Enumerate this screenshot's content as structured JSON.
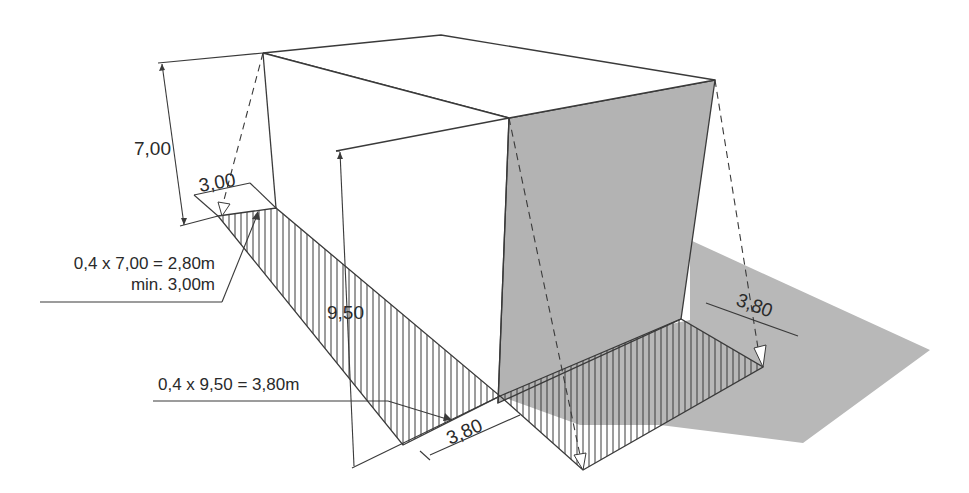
{
  "diagram": {
    "type": "building-clearance-isometric",
    "colors": {
      "line": "#3a3a3a",
      "shade": "#b8b8b8",
      "shade_dark": "#a9a9a9",
      "background": "#ffffff"
    },
    "dimensions": {
      "height_low": "7,00",
      "height_high": "9,50",
      "width_low": "3,00",
      "width_front": "3,80",
      "width_right": "3,80"
    },
    "annotations": {
      "low_formula": "0,4 x 7,00 = 2,80m",
      "low_minimum": "min. 3,00m",
      "high_formula": "0,4 x 9,50 = 3,80m"
    }
  }
}
